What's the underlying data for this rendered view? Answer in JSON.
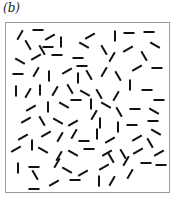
{
  "figure": {
    "panel_label": "(b)",
    "box": {
      "width": 165,
      "height": 171,
      "border_color": "#9a9a9a"
    },
    "segment_style": {
      "color": "#111111",
      "length": 11,
      "thickness": 2
    },
    "segments": [
      [
        14,
        12,
        -60
      ],
      [
        32,
        7,
        0
      ],
      [
        22,
        22,
        60
      ],
      [
        44,
        14,
        -30
      ],
      [
        42,
        24,
        0
      ],
      [
        55,
        19,
        90
      ],
      [
        36,
        27,
        60
      ],
      [
        84,
        13,
        -30
      ],
      [
        78,
        22,
        30
      ],
      [
        98,
        27,
        60
      ],
      [
        109,
        13,
        90
      ],
      [
        123,
        10,
        0
      ],
      [
        143,
        9,
        0
      ],
      [
        149,
        22,
        30
      ],
      [
        14,
        38,
        30
      ],
      [
        30,
        34,
        -30
      ],
      [
        51,
        32,
        0
      ],
      [
        72,
        35,
        0
      ],
      [
        106,
        34,
        -60
      ],
      [
        122,
        26,
        -30
      ],
      [
        138,
        33,
        60
      ],
      [
        12,
        51,
        0
      ],
      [
        30,
        49,
        -60
      ],
      [
        43,
        53,
        90
      ],
      [
        61,
        48,
        -30
      ],
      [
        76,
        43,
        0
      ],
      [
        72,
        55,
        90
      ],
      [
        83,
        52,
        60
      ],
      [
        98,
        49,
        -60
      ],
      [
        112,
        53,
        60
      ],
      [
        131,
        45,
        -30
      ],
      [
        151,
        45,
        0
      ],
      [
        10,
        68,
        90
      ],
      [
        22,
        70,
        -60
      ],
      [
        34,
        67,
        90
      ],
      [
        49,
        68,
        -60
      ],
      [
        64,
        66,
        60
      ],
      [
        79,
        70,
        30
      ],
      [
        93,
        71,
        60
      ],
      [
        110,
        73,
        -60
      ],
      [
        124,
        62,
        90
      ],
      [
        141,
        67,
        0
      ],
      [
        153,
        77,
        0
      ],
      [
        25,
        85,
        -30
      ],
      [
        42,
        84,
        90
      ],
      [
        58,
        82,
        30
      ],
      [
        70,
        77,
        0
      ],
      [
        85,
        81,
        90
      ],
      [
        100,
        82,
        30
      ],
      [
        113,
        89,
        60
      ],
      [
        129,
        86,
        0
      ],
      [
        148,
        88,
        30
      ],
      [
        20,
        97,
        -30
      ],
      [
        36,
        98,
        60
      ],
      [
        52,
        98,
        30
      ],
      [
        67,
        100,
        -30
      ],
      [
        88,
        92,
        -60
      ],
      [
        94,
        100,
        90
      ],
      [
        112,
        104,
        90
      ],
      [
        126,
        102,
        0
      ],
      [
        147,
        98,
        0
      ],
      [
        17,
        114,
        -30
      ],
      [
        40,
        111,
        -30
      ],
      [
        54,
        114,
        -60
      ],
      [
        68,
        111,
        -60
      ],
      [
        78,
        118,
        0
      ],
      [
        91,
        111,
        90
      ],
      [
        104,
        117,
        -30
      ],
      [
        131,
        115,
        -30
      ],
      [
        150,
        109,
        30
      ],
      [
        144,
        120,
        60
      ],
      [
        10,
        126,
        -30
      ],
      [
        26,
        122,
        90
      ],
      [
        37,
        127,
        30
      ],
      [
        53,
        133,
        -60
      ],
      [
        67,
        130,
        30
      ],
      [
        83,
        126,
        0
      ],
      [
        101,
        130,
        -30
      ],
      [
        117,
        131,
        60
      ],
      [
        132,
        128,
        -30
      ],
      [
        153,
        130,
        -30
      ],
      [
        12,
        145,
        90
      ],
      [
        28,
        144,
        0
      ],
      [
        29,
        152,
        60
      ],
      [
        51,
        140,
        -60
      ],
      [
        61,
        147,
        30
      ],
      [
        77,
        150,
        -30
      ],
      [
        98,
        144,
        -30
      ],
      [
        105,
        135,
        60
      ],
      [
        120,
        138,
        -60
      ],
      [
        140,
        140,
        0
      ],
      [
        155,
        142,
        0
      ],
      [
        48,
        160,
        -30
      ],
      [
        28,
        166,
        0
      ],
      [
        69,
        157,
        0
      ],
      [
        93,
        158,
        90
      ],
      [
        106,
        158,
        -60
      ],
      [
        124,
        151,
        -60
      ]
    ]
  }
}
